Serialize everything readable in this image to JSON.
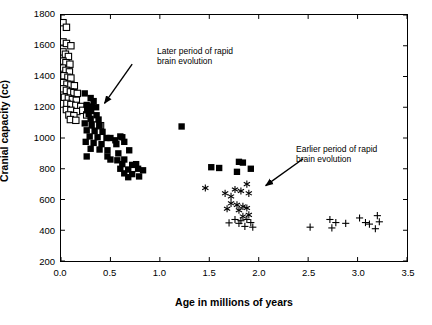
{
  "chart_data": {
    "type": "scatter",
    "title": "",
    "xlabel": "Age in millions of years",
    "ylabel": "Cranial capacity (cc)",
    "xlim": [
      0.0,
      3.5
    ],
    "ylim": [
      200,
      1800
    ],
    "xticks": [
      "0.0",
      "0.5",
      "1.0",
      "1.5",
      "2.0",
      "2.5",
      "3.0",
      "3.5"
    ],
    "yticks": [
      "200",
      "400",
      "600",
      "800",
      "1000",
      "1200",
      "1400",
      "1600",
      "1800"
    ],
    "grid": false,
    "legend": "none",
    "annotations": [
      {
        "id": "later-period",
        "text": "Later period of rapid\nbrain evolution",
        "line1": "Later period of rapid",
        "line2": "brain evolution",
        "arrow_from": [
          0.72,
          1480
        ],
        "arrow_to": [
          0.44,
          1225
        ]
      },
      {
        "id": "earlier-period",
        "text": "Earlier period of rapid\nbrain evolution",
        "line1": "Earlier period of rapid",
        "line2": "brain evolution",
        "arrow_from": [
          2.45,
          865
        ],
        "arrow_to": [
          2.07,
          690
        ]
      }
    ],
    "series": [
      {
        "name": "open squares",
        "marker": "open-square",
        "color": "#000000",
        "points": [
          [
            0.02,
            1750
          ],
          [
            0.055,
            1720
          ],
          [
            0.02,
            1625
          ],
          [
            0.055,
            1615
          ],
          [
            0.1,
            1600
          ],
          [
            0.02,
            1560
          ],
          [
            0.045,
            1545
          ],
          [
            0.075,
            1530
          ],
          [
            0.02,
            1500
          ],
          [
            0.05,
            1490
          ],
          [
            0.09,
            1480
          ],
          [
            0.015,
            1455
          ],
          [
            0.05,
            1440
          ],
          [
            0.085,
            1430
          ],
          [
            0.03,
            1405
          ],
          [
            0.07,
            1395
          ],
          [
            0.1,
            1390
          ],
          [
            0.02,
            1360
          ],
          [
            0.06,
            1350
          ],
          [
            0.1,
            1345
          ],
          [
            0.135,
            1340
          ],
          [
            0.02,
            1320
          ],
          [
            0.055,
            1310
          ],
          [
            0.095,
            1300
          ],
          [
            0.13,
            1295
          ],
          [
            0.165,
            1290
          ],
          [
            0.035,
            1265
          ],
          [
            0.075,
            1258
          ],
          [
            0.115,
            1250
          ],
          [
            0.155,
            1245
          ],
          [
            0.06,
            1225
          ],
          [
            0.1,
            1218
          ],
          [
            0.15,
            1212
          ],
          [
            0.2,
            1205
          ],
          [
            0.055,
            1185
          ],
          [
            0.1,
            1180
          ],
          [
            0.16,
            1172
          ],
          [
            0.08,
            1150
          ],
          [
            0.13,
            1145
          ],
          [
            0.095,
            1120
          ],
          [
            0.15,
            1115
          ],
          [
            0.22,
            1180
          ],
          [
            0.26,
            1150
          ],
          [
            0.33,
            1085
          ],
          [
            0.4,
            1080
          ]
        ]
      },
      {
        "name": "filled squares",
        "marker": "filled-square",
        "color": "#000000",
        "points": [
          [
            0.24,
            1290
          ],
          [
            0.3,
            1260
          ],
          [
            0.33,
            1240
          ],
          [
            0.26,
            1215
          ],
          [
            0.31,
            1205
          ],
          [
            0.355,
            1200
          ],
          [
            0.265,
            1180
          ],
          [
            0.305,
            1175
          ],
          [
            0.28,
            1155
          ],
          [
            0.36,
            1148
          ],
          [
            0.3,
            1125
          ],
          [
            0.38,
            1120
          ],
          [
            0.24,
            1095
          ],
          [
            0.31,
            1085
          ],
          [
            0.39,
            1080
          ],
          [
            0.26,
            1050
          ],
          [
            0.34,
            1045
          ],
          [
            0.42,
            1040
          ],
          [
            0.29,
            1010
          ],
          [
            0.37,
            1005
          ],
          [
            0.46,
            1000
          ],
          [
            0.25,
            975
          ],
          [
            0.33,
            968
          ],
          [
            0.41,
            960
          ],
          [
            0.5,
            1000
          ],
          [
            0.62,
            1005
          ],
          [
            0.6,
            1010
          ],
          [
            0.3,
            930
          ],
          [
            0.39,
            925
          ],
          [
            0.47,
            920
          ],
          [
            0.55,
            985
          ],
          [
            0.56,
            960
          ],
          [
            0.64,
            975
          ],
          [
            0.26,
            880
          ],
          [
            0.47,
            880
          ],
          [
            0.58,
            900
          ],
          [
            0.69,
            920
          ],
          [
            0.5,
            860
          ],
          [
            0.57,
            855
          ],
          [
            0.64,
            860
          ],
          [
            0.62,
            830
          ],
          [
            0.72,
            825
          ],
          [
            0.76,
            830
          ],
          [
            0.6,
            800
          ],
          [
            0.68,
            795
          ],
          [
            0.78,
            800
          ],
          [
            0.64,
            770
          ],
          [
            0.72,
            765
          ],
          [
            0.83,
            790
          ],
          [
            0.68,
            745
          ],
          [
            0.79,
            750
          ],
          [
            1.22,
            1075
          ],
          [
            1.52,
            810
          ],
          [
            1.6,
            805
          ],
          [
            1.8,
            845
          ],
          [
            1.84,
            840
          ],
          [
            1.92,
            800
          ],
          [
            1.78,
            780
          ]
        ]
      },
      {
        "name": "asterisks",
        "marker": "asterisk",
        "color": "#000000",
        "points": [
          [
            1.46,
            675
          ],
          [
            1.66,
            640
          ],
          [
            1.72,
            620
          ],
          [
            1.76,
            665
          ],
          [
            1.82,
            655
          ],
          [
            1.88,
            700
          ],
          [
            1.9,
            640
          ],
          [
            1.72,
            575
          ],
          [
            1.78,
            565
          ],
          [
            1.84,
            555
          ],
          [
            1.68,
            540
          ],
          [
            1.8,
            530
          ],
          [
            1.88,
            545
          ],
          [
            1.9,
            500
          ],
          [
            1.84,
            490
          ]
        ]
      },
      {
        "name": "plus signs",
        "marker": "plus",
        "color": "#000000",
        "points": [
          [
            1.76,
            470
          ],
          [
            1.82,
            462
          ],
          [
            1.88,
            470
          ],
          [
            1.7,
            448
          ],
          [
            1.8,
            445
          ],
          [
            1.92,
            450
          ],
          [
            1.86,
            425
          ],
          [
            1.94,
            420
          ],
          [
            2.52,
            420
          ],
          [
            2.72,
            470
          ],
          [
            2.78,
            450
          ],
          [
            2.88,
            445
          ],
          [
            3.02,
            480
          ],
          [
            3.08,
            450
          ],
          [
            3.12,
            440
          ],
          [
            3.2,
            495
          ],
          [
            3.22,
            455
          ],
          [
            3.18,
            410
          ],
          [
            2.74,
            415
          ]
        ]
      }
    ]
  }
}
